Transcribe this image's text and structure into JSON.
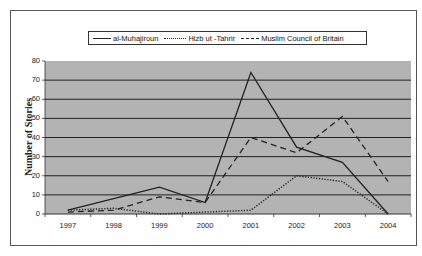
{
  "chart_data": {
    "type": "line",
    "title": "",
    "xlabel": "",
    "ylabel": "Number of Stories",
    "categories": [
      "1997",
      "1998",
      "1999",
      "2000",
      "2001",
      "2002",
      "2003",
      "2004"
    ],
    "series": [
      {
        "name": "al-Muhajiroun",
        "style": "solid",
        "values": [
          2,
          8,
          14,
          6,
          74,
          35,
          27,
          0
        ]
      },
      {
        "name": "Hizb ut -Tahrir",
        "style": "dotted",
        "values": [
          2,
          3,
          0,
          1,
          2,
          20,
          17,
          0
        ]
      },
      {
        "name": "Muslim Council of Britain",
        "style": "dashed",
        "values": [
          1,
          2,
          9,
          6,
          40,
          32,
          51,
          17
        ]
      }
    ],
    "ylim": [
      0,
      80
    ],
    "yticks": [
      "80",
      "70",
      "60",
      "50",
      "40",
      "30",
      "20",
      "10",
      "0"
    ],
    "grid": true,
    "legend_position": "top",
    "colors": {
      "plot_background": "#b3b3b3",
      "gridline": "#222222",
      "line": "#222222"
    }
  },
  "legend": {
    "items": [
      {
        "label": "al-Muhajiroun"
      },
      {
        "label": "Hizb ut -Tahrir"
      },
      {
        "label": "Muslim Council of Britain"
      }
    ]
  }
}
